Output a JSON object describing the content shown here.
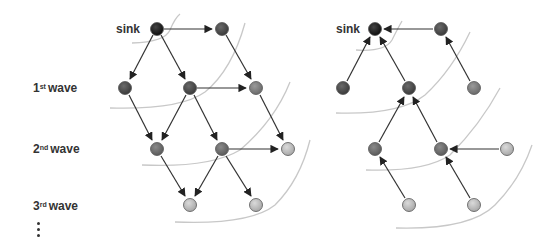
{
  "labels": {
    "sink_left": "sink",
    "sink_right": "sink",
    "waves": [
      {
        "num": "1",
        "suffix": "st",
        "word": "wave"
      },
      {
        "num": "2",
        "suffix": "nd",
        "word": "wave"
      },
      {
        "num": "3",
        "suffix": "rd",
        "word": "wave"
      }
    ],
    "ellipsis": "⋮"
  },
  "colors": {
    "sink": "#1a1a1a",
    "wave1": "#4a4a4a",
    "wave1_far": "#7a7a7a",
    "wave2": "#6a6a6a",
    "wave3": "#b8b8b8",
    "edge": "#333333",
    "curve": "#c8c8c8"
  },
  "left_diagram": {
    "description": "Flooding waves propagating outward from sink",
    "nodes": [
      {
        "id": "L-sink",
        "x": 157,
        "y": 29,
        "level": "sink"
      },
      {
        "id": "L-a",
        "x": 222,
        "y": 29,
        "level": "wave1"
      },
      {
        "id": "L-b",
        "x": 125,
        "y": 88,
        "level": "wave1"
      },
      {
        "id": "L-c",
        "x": 190,
        "y": 88,
        "level": "wave1"
      },
      {
        "id": "L-d",
        "x": 256,
        "y": 88,
        "level": "wave1_far"
      },
      {
        "id": "L-e",
        "x": 157,
        "y": 149,
        "level": "wave2"
      },
      {
        "id": "L-f",
        "x": 222,
        "y": 149,
        "level": "wave2"
      },
      {
        "id": "L-g",
        "x": 288,
        "y": 149,
        "level": "wave3"
      },
      {
        "id": "L-h",
        "x": 190,
        "y": 205,
        "level": "wave3"
      },
      {
        "id": "L-i",
        "x": 256,
        "y": 205,
        "level": "wave3"
      }
    ],
    "edges": [
      [
        "L-sink",
        "L-a"
      ],
      [
        "L-sink",
        "L-b"
      ],
      [
        "L-sink",
        "L-c"
      ],
      [
        "L-a",
        "L-d"
      ],
      [
        "L-c",
        "L-d"
      ],
      [
        "L-b",
        "L-e"
      ],
      [
        "L-c",
        "L-e"
      ],
      [
        "L-c",
        "L-f"
      ],
      [
        "L-d",
        "L-g"
      ],
      [
        "L-f",
        "L-g"
      ],
      [
        "L-e",
        "L-h"
      ],
      [
        "L-f",
        "L-h"
      ],
      [
        "L-f",
        "L-i"
      ]
    ]
  },
  "right_diagram": {
    "description": "Reverse path data forwarding toward sink",
    "nodes": [
      {
        "id": "R-sink",
        "x": 375,
        "y": 29,
        "level": "sink"
      },
      {
        "id": "R-a",
        "x": 441,
        "y": 29,
        "level": "wave1"
      },
      {
        "id": "R-b",
        "x": 343,
        "y": 88,
        "level": "wave1"
      },
      {
        "id": "R-c",
        "x": 409,
        "y": 88,
        "level": "wave1"
      },
      {
        "id": "R-d",
        "x": 474,
        "y": 88,
        "level": "wave1_far"
      },
      {
        "id": "R-e",
        "x": 375,
        "y": 149,
        "level": "wave2"
      },
      {
        "id": "R-f",
        "x": 441,
        "y": 149,
        "level": "wave2"
      },
      {
        "id": "R-g",
        "x": 507,
        "y": 149,
        "level": "wave3"
      },
      {
        "id": "R-h",
        "x": 409,
        "y": 205,
        "level": "wave3"
      },
      {
        "id": "R-i",
        "x": 474,
        "y": 205,
        "level": "wave3"
      }
    ],
    "edges": [
      [
        "R-a",
        "R-sink"
      ],
      [
        "R-b",
        "R-sink"
      ],
      [
        "R-c",
        "R-sink"
      ],
      [
        "R-d",
        "R-a"
      ],
      [
        "R-e",
        "R-c"
      ],
      [
        "R-f",
        "R-c"
      ],
      [
        "R-g",
        "R-f"
      ],
      [
        "R-h",
        "R-e"
      ],
      [
        "R-i",
        "R-f"
      ]
    ]
  }
}
